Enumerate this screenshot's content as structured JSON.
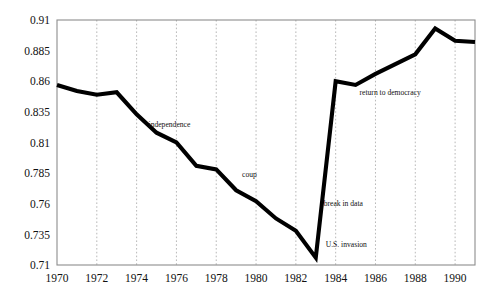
{
  "chart_data": {
    "type": "line",
    "title": "",
    "subtitle": "",
    "xlabel": "",
    "ylabel": "",
    "xlim": [
      1970,
      1991
    ],
    "ylim": [
      0.71,
      0.91
    ],
    "grid": "vertical-dotted-at-even-years",
    "legend": "none",
    "x_tick_labels": [
      "1970",
      "1972",
      "1974",
      "1976",
      "1978",
      "1980",
      "1982",
      "1984",
      "1986",
      "1988",
      "1990"
    ],
    "x_ticks": [
      1970,
      1972,
      1974,
      1976,
      1978,
      1980,
      1982,
      1984,
      1986,
      1988,
      1990
    ],
    "y_tick_labels": [
      "0.71",
      "0.735",
      "0.76",
      "0.785",
      "0.81",
      "0.835",
      "0.86",
      "0.885",
      "0.91"
    ],
    "y_ticks": [
      0.71,
      0.735,
      0.76,
      0.785,
      0.81,
      0.835,
      0.86,
      0.885,
      0.91
    ],
    "series": [
      {
        "name": "index",
        "color": "#000000",
        "x": [
          1970,
          1971,
          1972,
          1973,
          1974,
          1975,
          1976,
          1977,
          1978,
          1979,
          1980,
          1981,
          1982,
          1983,
          1984,
          1985,
          1986,
          1987,
          1988,
          1989,
          1990,
          1991
        ],
        "values": [
          0.857,
          0.852,
          0.849,
          0.851,
          0.833,
          0.818,
          0.81,
          0.791,
          0.788,
          0.771,
          0.762,
          0.748,
          0.738,
          0.716,
          0.86,
          0.857,
          0.866,
          0.874,
          0.882,
          0.903,
          0.893,
          0.892
        ]
      }
    ],
    "annotations": [
      {
        "label": "independence",
        "x": 1974.6,
        "y": 0.8225
      },
      {
        "label": "coup",
        "x": 1979.3,
        "y": 0.7815
      },
      {
        "label": "break in data",
        "x": 1983.4,
        "y": 0.7585
      },
      {
        "label": "U.S. invasion",
        "x": 1983.5,
        "y": 0.7245
      },
      {
        "label": "return to democracy",
        "x": 1985.2,
        "y": 0.8485
      }
    ]
  },
  "axis": {
    "y_labels": [
      "0.91",
      "0.885",
      "0.86",
      "0.835",
      "0.81",
      "0.785",
      "0.76",
      "0.735",
      "0.71"
    ],
    "x_labels": [
      "1970",
      "1972",
      "1974",
      "1976",
      "1978",
      "1980",
      "1982",
      "1984",
      "1986",
      "1988",
      "1990"
    ]
  },
  "annotations": {
    "independence": "independence",
    "coup": "coup",
    "break_in_data": "break in data",
    "us_invasion": "U.S. invasion",
    "return_to_democracy": "return to democracy"
  },
  "colors": {
    "series": "#000000",
    "grid": "#9a9a9a",
    "frame": "#8d8d8d",
    "background": "#ffffff",
    "text": "#111111"
  }
}
